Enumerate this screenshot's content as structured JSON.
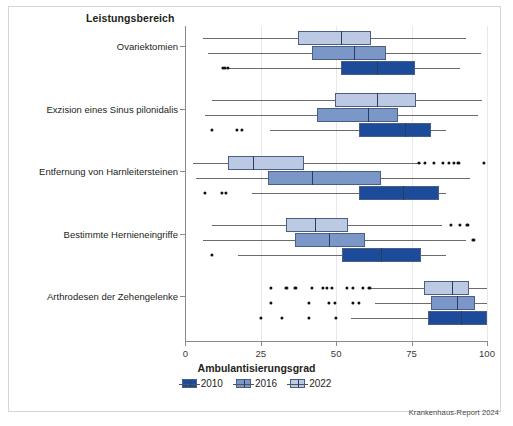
{
  "figure": {
    "legend_title": "Leistungsbereich",
    "source_note": "Krankenhaus-Report 2024"
  },
  "colors": {
    "series_2010": "#1c4b99",
    "series_2016": "#7a97c8",
    "series_2022": "#bcc9e2",
    "box_border": "#4b5f86",
    "median": "#2c3c5c",
    "whisker": "#6b6b6b",
    "outlier": "#111111",
    "grid": "#e8e8ec",
    "axis": "#8a8a8a",
    "frame": "#d5d5d5"
  },
  "chart_data": {
    "type": "box",
    "title": "Leistungsbereich",
    "xlabel": "Ambulantisierungsgrad",
    "ylabel": "Leistungsbereich",
    "xlim": [
      0,
      100
    ],
    "xticks": [
      0,
      25,
      50,
      75,
      100
    ],
    "xticklabels": [
      "0",
      "25",
      "50",
      "75",
      "100"
    ],
    "grid": "vertical",
    "legend_position": "bottom-center",
    "orientation": "horizontal",
    "categories": [
      "Ovariektomien",
      "Exzision eines Sinus pilonidalis",
      "Entfernung von Harnleitersteinen",
      "Bestimmte Hernieneingriffe",
      "Arthrodesen der Zehengelenke"
    ],
    "series": [
      {
        "name": "2010",
        "color": "#1c4b99",
        "boxes": [
          {
            "category": "Ovariektomien",
            "whisker_low": 12.2,
            "q1": 51.5,
            "median": 63.5,
            "q3": 76.0,
            "whisker_high": 91.0,
            "outliers": [
              12.4,
              13.2,
              14.0
            ]
          },
          {
            "category": "Exzision eines Sinus pilonidalis",
            "whisker_low": 28.0,
            "q1": 57.5,
            "median": 72.8,
            "q3": 81.5,
            "whisker_high": 86.5,
            "outliers": [
              8.8,
              17.2,
              18.8
            ]
          },
          {
            "category": "Entfernung von Harnleitersteinen",
            "whisker_low": 22.0,
            "q1": 57.5,
            "median": 72.0,
            "q3": 84.0,
            "whisker_high": 86.5,
            "outliers": [
              6.5,
              12.2,
              13.5
            ]
          },
          {
            "category": "Bestimmte Hernieneingriffe",
            "whisker_low": 17.5,
            "q1": 52.0,
            "median": 65.0,
            "q3": 78.0,
            "whisker_high": 86.5,
            "outliers": [
              8.8
            ]
          },
          {
            "category": "Arthrodesen der Zehengelenke",
            "whisker_low": 55.0,
            "q1": 80.5,
            "median": 91.5,
            "q3": 100.0,
            "whisker_high": 100.0,
            "outliers": [
              25.0,
              32.0,
              41.0,
              50.0
            ]
          }
        ]
      },
      {
        "name": "2016",
        "color": "#7a97c8",
        "boxes": [
          {
            "category": "Ovariektomien",
            "whisker_low": 7.5,
            "q1": 42.0,
            "median": 56.0,
            "q3": 66.5,
            "whisker_high": 98.0,
            "outliers": []
          },
          {
            "category": "Exzision eines Sinus pilonidalis",
            "whisker_low": 6.5,
            "q1": 43.5,
            "median": 60.5,
            "q3": 70.5,
            "whisker_high": 97.0,
            "outliers": []
          },
          {
            "category": "Entfernung von Harnleitersteinen",
            "whisker_low": 3.5,
            "q1": 27.5,
            "median": 42.0,
            "q3": 65.0,
            "whisker_high": 94.5,
            "outliers": []
          },
          {
            "category": "Bestimmte Hernieneingriffe",
            "whisker_low": 6.0,
            "q1": 36.5,
            "median": 47.5,
            "q3": 59.5,
            "whisker_high": 93.0,
            "outliers": [
              95.5
            ]
          },
          {
            "category": "Arthrodesen der Zehengelenke",
            "whisker_low": 63.0,
            "q1": 81.5,
            "median": 90.0,
            "q3": 96.0,
            "whisker_high": 100.0,
            "outliers": [
              28.5,
              41.0,
              47.5,
              49.5,
              55.5,
              57.5
            ]
          }
        ]
      },
      {
        "name": "2022",
        "color": "#bcc9e2",
        "boxes": [
          {
            "category": "Ovariektomien",
            "whisker_low": 6.0,
            "q1": 37.5,
            "median": 51.5,
            "q3": 61.5,
            "whisker_high": 93.0,
            "outliers": []
          },
          {
            "category": "Exzision eines Sinus pilonidalis",
            "whisker_low": 9.0,
            "q1": 49.5,
            "median": 63.5,
            "q3": 76.5,
            "whisker_high": 98.5,
            "outliers": []
          },
          {
            "category": "Entfernung von Harnleitersteinen",
            "whisker_low": 2.5,
            "q1": 14.0,
            "median": 22.5,
            "q3": 39.5,
            "whisker_high": 78.0,
            "outliers": [
              77.5,
              79.5,
              82.5,
              85.5,
              87.5,
              89.0,
              90.5,
              99.0
            ]
          },
          {
            "category": "Bestimmte Hernieneingriffe",
            "whisker_low": 9.0,
            "q1": 33.5,
            "median": 43.0,
            "q3": 54.0,
            "whisker_high": 85.0,
            "outliers": [
              88.0,
              91.0,
              93.5
            ]
          },
          {
            "category": "Arthrodesen der Zehengelenke",
            "whisker_low": 61.0,
            "q1": 79.0,
            "median": 88.5,
            "q3": 94.0,
            "whisker_high": 100.0,
            "outliers": [
              28.5,
              33.5,
              36.5,
              42.0,
              45.5,
              47.0,
              48.5,
              53.5,
              55.5,
              59.0,
              61.0
            ]
          }
        ]
      }
    ]
  },
  "legend": {
    "entries": [
      {
        "label": "2010",
        "color": "#1c4b99"
      },
      {
        "label": "2016",
        "color": "#7a97c8"
      },
      {
        "label": "2022",
        "color": "#bcc9e2"
      }
    ]
  }
}
